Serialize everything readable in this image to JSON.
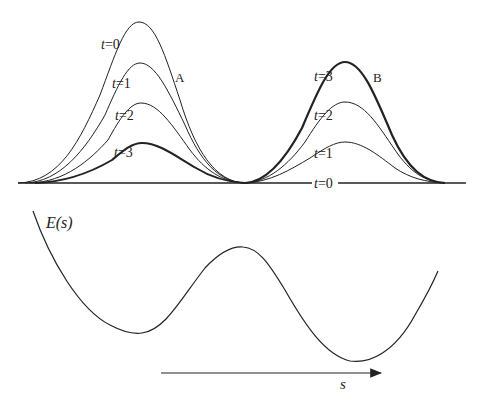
{
  "figure": {
    "top_panel": {
      "description": "Probability distributions over reaction coordinate at successive times",
      "well_labels": {
        "A": "A",
        "B": "B"
      },
      "time_labels_A": [
        "t=0",
        "t=1",
        "t=2",
        "t=3"
      ],
      "time_labels_B": [
        "t=3",
        "t=2",
        "t=1",
        "t=0"
      ],
      "baseline_label": "t=0"
    },
    "bottom_panel": {
      "energy_label": "E(s)",
      "axis_label": "s"
    },
    "colors": {
      "line": "#222222",
      "background": "#ffffff"
    }
  },
  "labels": {
    "A_t0": "t=0",
    "A_t1": "t=1",
    "A_t2": "t=2",
    "A_t3": "t=3",
    "A": "A",
    "B_t3": "t=3",
    "B_t2": "t=2",
    "B_t1": "t=1",
    "B_t0": "t=0",
    "B": "B",
    "energy": "E(s)",
    "s": "s"
  }
}
